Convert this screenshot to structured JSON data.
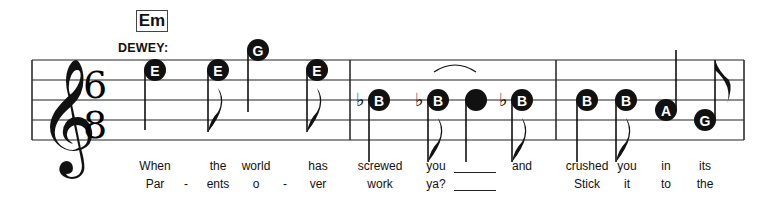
{
  "chord": "Em",
  "singer": "DEWEY:",
  "time_signature": {
    "top": "6",
    "bottom": "8"
  },
  "clef": "treble",
  "notes": [
    {
      "letter": "E",
      "x": 155,
      "y": 70,
      "stem": "up-left",
      "flag": false,
      "flat": false
    },
    {
      "letter": "E",
      "x": 218,
      "y": 70,
      "stem": "down-left",
      "flag": true,
      "flat": false
    },
    {
      "letter": "G",
      "x": 258,
      "y": 50,
      "stem": "down-left",
      "flag": false,
      "flat": false
    },
    {
      "letter": "E",
      "x": 317,
      "y": 70,
      "stem": "down-left",
      "flag": true,
      "flat": false
    },
    {
      "letter": "B",
      "x": 379,
      "y": 100,
      "stem": "down-left",
      "flag": false,
      "flat": true
    },
    {
      "letter": "B",
      "x": 438,
      "y": 100,
      "stem": "down-left",
      "flag": true,
      "flat": true
    },
    {
      "letter": "",
      "x": 476,
      "y": 100,
      "stem": "down-left",
      "flag": false,
      "flat": false,
      "tied": true
    },
    {
      "letter": "B",
      "x": 522,
      "y": 100,
      "stem": "down-left",
      "flag": true,
      "flat": true
    },
    {
      "letter": "B",
      "x": 587,
      "y": 100,
      "stem": "down-left",
      "flag": false,
      "flat": false
    },
    {
      "letter": "B",
      "x": 626,
      "y": 100,
      "stem": "down-left",
      "flag": true,
      "flat": false
    },
    {
      "letter": "A",
      "x": 666,
      "y": 110,
      "stem": "up-right",
      "flag": false,
      "flat": false
    },
    {
      "letter": "G",
      "x": 705,
      "y": 120,
      "stem": "up-right",
      "flag": true,
      "flat": false
    }
  ],
  "lyrics": {
    "verse1": [
      {
        "text": "When",
        "x": 155
      },
      {
        "text": "the",
        "x": 218
      },
      {
        "text": "world",
        "x": 256
      },
      {
        "text": "has",
        "x": 318
      },
      {
        "text": "screwed",
        "x": 380
      },
      {
        "text": "you",
        "x": 436
      },
      {
        "text": "and",
        "x": 522
      },
      {
        "text": "crushed",
        "x": 587
      },
      {
        "text": "you",
        "x": 627
      },
      {
        "text": "in",
        "x": 666
      },
      {
        "text": "its",
        "x": 705
      }
    ],
    "verse2": [
      {
        "text": "Par",
        "x": 155
      },
      {
        "text": "-",
        "x": 186
      },
      {
        "text": "ents",
        "x": 218
      },
      {
        "text": "o",
        "x": 256
      },
      {
        "text": "-",
        "x": 285
      },
      {
        "text": "ver",
        "x": 318
      },
      {
        "text": "work",
        "x": 380
      },
      {
        "text": "ya?",
        "x": 436
      },
      {
        "text": "Stick",
        "x": 587
      },
      {
        "text": "it",
        "x": 627
      },
      {
        "text": "to",
        "x": 666
      },
      {
        "text": "the",
        "x": 705
      }
    ]
  },
  "barlines": [
    350,
    556,
    744
  ]
}
